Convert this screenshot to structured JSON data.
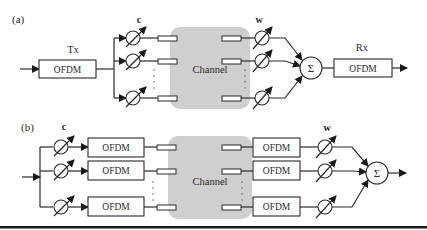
{
  "figure": {
    "panel_a": {
      "label": "(a)",
      "tx_label": "Tx",
      "tx_block": "OFDM",
      "tx_weights_label": "c",
      "channel_label": "Channel",
      "rx_weights_label": "w",
      "sum_symbol": "Σ",
      "rx_label": "Rx",
      "rx_block": "OFDM"
    },
    "panel_b": {
      "label": "(b)",
      "tx_weights_label": "c",
      "tx_blocks": [
        "OFDM",
        "OFDM",
        "OFDM"
      ],
      "channel_label": "Channel",
      "rx_blocks": [
        "OFDM",
        "OFDM",
        "OFDM"
      ],
      "rx_weights_label": "w",
      "sum_symbol": "Σ"
    },
    "colors": {
      "line": "#2b2b2b",
      "channel_fill": "#cfcfcf",
      "background": "#ffffff",
      "bottom_rule": "#1a1a1a"
    }
  }
}
